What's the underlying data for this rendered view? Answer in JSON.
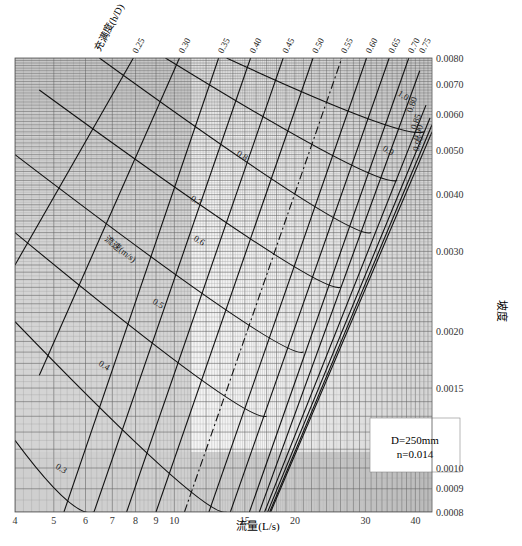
{
  "chart_data": {
    "type": "line",
    "title": "",
    "subtitle": "",
    "xlabel": "流量(L/s)",
    "ylabel": "坡度",
    "xscale": "log",
    "yscale": "log",
    "xlim": [
      4,
      44
    ],
    "ylim": [
      0.0008,
      0.008
    ],
    "grid": true,
    "legend_position": "none",
    "x_ticks": [
      "4",
      "5",
      "6",
      "7",
      "8",
      "9",
      "10",
      "15",
      "20",
      "30",
      "40"
    ],
    "y_ticks": [
      "0.0080",
      "0.0070",
      "0.0060",
      "0.0050",
      "0.0040",
      "0.0030",
      "0.0020",
      "0.0015",
      "0.0010",
      "0.0009",
      "0.0008"
    ],
    "annotations": {
      "pipe_params": [
        "D=250mm",
        "n=0.014"
      ],
      "fullness_title": "充满度(h/D)",
      "velocity_title": "流速(m/s)"
    },
    "fullness_labels": [
      "0.25",
      "0.30",
      "0.35",
      "0.40",
      "0.45",
      "0.50",
      "0.55",
      "0.60",
      "0.65",
      "0.70",
      "0.75",
      "0.80",
      "0.85",
      "0.90",
      "0.95"
    ],
    "velocity_labels": [
      "0.3",
      "0.4",
      "0.5",
      "0.6",
      "0.7",
      "0.8",
      "0.9",
      "1.0"
    ],
    "series": [
      {
        "name": "h/D=0.25",
        "kind": "fullness",
        "x": [
          4.0,
          7.9
        ],
        "y": [
          0.0028,
          0.008
        ]
      },
      {
        "name": "h/D=0.30",
        "kind": "fullness",
        "x": [
          4.6,
          10.3
        ],
        "y": [
          0.0016,
          0.008
        ]
      },
      {
        "name": "h/D=0.35",
        "kind": "fullness",
        "x": [
          5.3,
          12.9
        ],
        "y": [
          0.0008,
          0.008
        ]
      },
      {
        "name": "h/D=0.40",
        "kind": "fullness",
        "x": [
          6.3,
          15.5
        ],
        "y": [
          0.0008,
          0.008
        ]
      },
      {
        "name": "h/D=0.45",
        "kind": "fullness",
        "x": [
          7.6,
          18.7
        ],
        "y": [
          0.0008,
          0.008
        ]
      },
      {
        "name": "h/D=0.50",
        "kind": "fullness",
        "x": [
          9.0,
          22.2
        ],
        "y": [
          0.0008,
          0.008
        ]
      },
      {
        "name": "h/D=0.55",
        "kind": "fullness",
        "x": [
          10.6,
          26.2
        ],
        "y": [
          0.0008,
          0.008
        ]
      },
      {
        "name": "h/D=0.60",
        "kind": "fullness",
        "x": [
          12.2,
          30.2
        ],
        "y": [
          0.0008,
          0.008
        ]
      },
      {
        "name": "h/D=0.65",
        "kind": "fullness",
        "x": [
          13.8,
          34.4
        ],
        "y": [
          0.0008,
          0.008
        ]
      },
      {
        "name": "h/D=0.70",
        "kind": "fullness",
        "x": [
          15.4,
          38.5
        ],
        "y": [
          0.0008,
          0.008
        ]
      },
      {
        "name": "h/D=0.75",
        "kind": "fullness",
        "x": [
          16.3,
          41.0
        ],
        "y": [
          0.0008,
          0.0075
        ]
      },
      {
        "name": "h/D=0.80",
        "kind": "fullness",
        "x": [
          16.8,
          42.5
        ],
        "y": [
          0.0008,
          0.0063
        ]
      },
      {
        "name": "h/D=0.85",
        "kind": "fullness",
        "x": [
          17.1,
          43.5
        ],
        "y": [
          0.0008,
          0.0059
        ]
      },
      {
        "name": "h/D=0.90",
        "kind": "fullness",
        "x": [
          17.3,
          44.0
        ],
        "y": [
          0.0008,
          0.0057
        ]
      },
      {
        "name": "h/D=0.95",
        "kind": "fullness",
        "x": [
          17.4,
          44.0
        ],
        "y": [
          0.0008,
          0.0055
        ]
      },
      {
        "name": "v=0.3",
        "kind": "velocity",
        "x": [
          4.0,
          6.3
        ],
        "y": [
          0.00115,
          0.0008
        ]
      },
      {
        "name": "v=0.4",
        "kind": "velocity",
        "x": [
          4.0,
          13.5
        ],
        "y": [
          0.0021,
          0.0008
        ]
      },
      {
        "name": "v=0.5",
        "kind": "velocity",
        "x": [
          4.0,
          17.0
        ],
        "y": [
          0.0033,
          0.0013
        ]
      },
      {
        "name": "v=0.6",
        "kind": "velocity",
        "x": [
          4.0,
          21.0
        ],
        "y": [
          0.0049,
          0.0018
        ]
      },
      {
        "name": "v=0.7",
        "kind": "velocity",
        "x": [
          4.6,
          26.0
        ],
        "y": [
          0.0068,
          0.0025
        ]
      },
      {
        "name": "v=0.8",
        "kind": "velocity",
        "x": [
          6.5,
          31.0
        ],
        "y": [
          0.008,
          0.0033
        ]
      },
      {
        "name": "v=0.9",
        "kind": "velocity",
        "x": [
          9.5,
          36.0
        ],
        "y": [
          0.008,
          0.0043
        ]
      },
      {
        "name": "v=1.0",
        "kind": "velocity",
        "x": [
          13.5,
          42.0
        ],
        "y": [
          0.008,
          0.0055
        ]
      }
    ]
  }
}
